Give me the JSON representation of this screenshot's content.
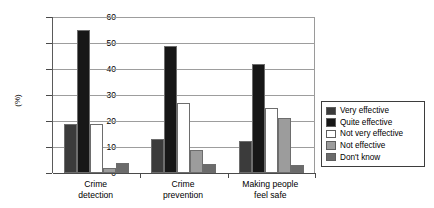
{
  "chart_data": {
    "type": "bar",
    "title": "",
    "xlabel": "",
    "ylabel": "(%)",
    "ylim": [
      0,
      60
    ],
    "ytick_step": 10,
    "yticks": [
      "60",
      "50",
      "40",
      "30",
      "20",
      "10",
      "0"
    ],
    "grid": true,
    "legend_position": "right",
    "categories": [
      "Crime detection",
      "Crime prevention",
      "Making people feel safe"
    ],
    "category_lines": [
      [
        "Crime",
        "detection"
      ],
      [
        "Crime",
        "prevention"
      ],
      [
        "Making people",
        "feel safe"
      ]
    ],
    "series": [
      {
        "name": "Very effective",
        "color": "#3b3b3b",
        "values": [
          19,
          13,
          12.5
        ]
      },
      {
        "name": "Quite effective",
        "color": "#171717",
        "values": [
          55,
          49,
          42
        ]
      },
      {
        "name": "Not very effective",
        "color": "#ffffff",
        "values": [
          19,
          27,
          25
        ]
      },
      {
        "name": "Not effective",
        "color": "#9c9c9c",
        "values": [
          2,
          9,
          21
        ]
      },
      {
        "name": "Don't know",
        "color": "#6b6b6b",
        "values": [
          4,
          3.5,
          3
        ]
      }
    ]
  },
  "legend": {
    "items": [
      {
        "label": "Very effective"
      },
      {
        "label": "Quite effective"
      },
      {
        "label": "Not very effective"
      },
      {
        "label": "Not effective"
      },
      {
        "label": "Don't know"
      }
    ]
  }
}
